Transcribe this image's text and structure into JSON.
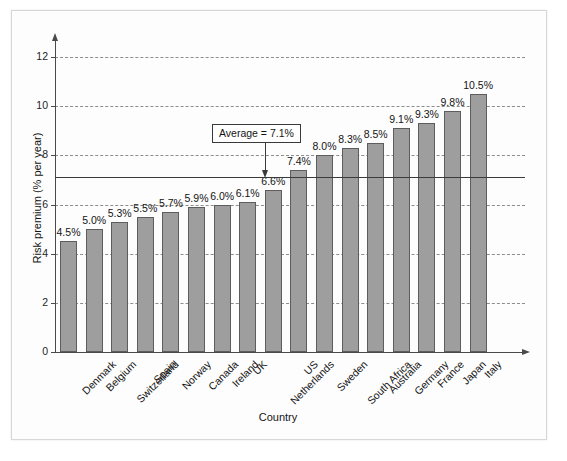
{
  "chart_data": {
    "type": "bar",
    "title": "",
    "xlabel": "Country",
    "ylabel": "Risk premium (% per year)",
    "categories": [
      "Denmark",
      "Belgium",
      "Switzerland",
      "Spain",
      "Norway",
      "Canada",
      "Ireland",
      "UK",
      "Netherlands",
      "US",
      "Sweden",
      "South Africa",
      "Australia",
      "Germany",
      "France",
      "Japan",
      "Italy"
    ],
    "values": [
      4.5,
      5.0,
      5.3,
      5.5,
      5.7,
      5.9,
      6.0,
      6.1,
      6.6,
      7.4,
      8.0,
      8.3,
      8.5,
      9.1,
      9.3,
      9.8,
      10.5
    ],
    "value_labels": [
      "4.5%",
      "5.0%",
      "5.3%",
      "5.5%",
      "5.7%",
      "5.9%",
      "6.0%",
      "6.1%",
      "6.6%",
      "7.4%",
      "8.0%",
      "8.3%",
      "8.5%",
      "9.1%",
      "9.3%",
      "9.8%",
      "10.5%"
    ],
    "ylim": [
      0,
      12.6
    ],
    "yticks": [
      0,
      2,
      4,
      6,
      8,
      10,
      12
    ],
    "ytick_labels": [
      "0",
      "2",
      "4",
      "6",
      "8",
      "10",
      "12"
    ],
    "gridlines": [
      2,
      4,
      6,
      8,
      10,
      12
    ],
    "grid": true,
    "legend": "none",
    "annotation": {
      "label": "Average = 7.1%",
      "value": 7.1
    },
    "bar_color": "#9e9e9e",
    "bar_edge_color": "#5d5d5d",
    "grid_color": "#8d8d8d",
    "axis_color": "#4a4a4a"
  }
}
